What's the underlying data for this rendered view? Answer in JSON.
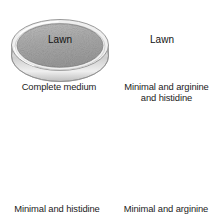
{
  "figure": {
    "background_color": "#ffffff",
    "width": 221,
    "height": 220
  },
  "colors": {
    "lawn_fill": "#a9a9a9",
    "lawn_fill_light": "#c6c6c6",
    "dish_rim": "#8f8f8f",
    "dish_rim_light": "#d8d8d8",
    "clear_agar": "#fdfdfd",
    "colony": "#111111",
    "text": "#1b1b1b",
    "arrow": "#1b1b1b"
  },
  "plates": [
    {
      "id": "plate-complete-medium",
      "label": "Complete medium",
      "surface_label": "Lawn",
      "surface_type": "confluent-lawn",
      "position": "top-left",
      "cx": 60,
      "cy": 45,
      "rx": 48,
      "ry": 25,
      "colonies": []
    },
    {
      "id": "plate-minimal-arginine-histidine",
      "label_line1": "Minimal and arginine",
      "label_line2": "and histidine",
      "label": "Minimal and arginine and histidine",
      "surface_label": "Lawn",
      "surface_type": "confluent-lawn",
      "position": "top-right",
      "cx": 162,
      "cy": 45,
      "rx": 48,
      "ry": 25,
      "colonies": []
    },
    {
      "id": "plate-minimal-histidine",
      "label": "Minimal and histidine",
      "surface_label": "",
      "surface_type": "isolated-colonies",
      "position": "bottom-left",
      "cx": 60,
      "cy": 168,
      "rx": 49,
      "ry": 26,
      "colony_count": 4,
      "colonies": [
        {
          "x": 68,
          "y": 154
        },
        {
          "x": 85,
          "y": 157
        },
        {
          "x": 30,
          "y": 173
        },
        {
          "x": 78,
          "y": 181
        }
      ]
    },
    {
      "id": "plate-minimal-arginine",
      "label": "Minimal and arginine",
      "surface_label": "",
      "surface_type": "isolated-colonies",
      "position": "bottom-right",
      "cx": 162,
      "cy": 168,
      "rx": 49,
      "ry": 26,
      "colony_count": 4,
      "colonies": [
        {
          "x": 137,
          "y": 153
        },
        {
          "x": 185,
          "y": 152
        },
        {
          "x": 148,
          "y": 176
        },
        {
          "x": 175,
          "y": 172
        }
      ]
    }
  ],
  "arrows": [
    {
      "id": "arrow-complete-to-minimal-arginine",
      "from": "plate-complete-medium",
      "to": "plate-minimal-arginine",
      "x1": 80,
      "y1": 99,
      "x2": 131,
      "y2": 133,
      "direction": "down-right"
    },
    {
      "id": "arrow-minimal-arghis-to-minimal-histidine",
      "from": "plate-minimal-arginine-histidine",
      "to": "plate-minimal-histidine",
      "x1": 131,
      "y1": 99,
      "x2": 80,
      "y2": 133,
      "direction": "down-left"
    }
  ]
}
